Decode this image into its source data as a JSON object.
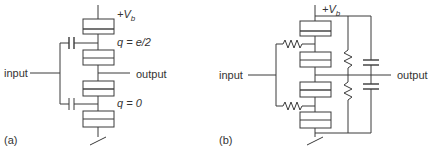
{
  "panel_a": {
    "tag": "(a)",
    "supply_label": "+V",
    "supply_sub": "b",
    "input_label": "input",
    "output_label": "output",
    "charge_upper": "q = e/2",
    "charge_lower": "q = 0"
  },
  "panel_b": {
    "tag": "(b)",
    "supply_label": "+V",
    "supply_sub": "b",
    "input_label": "input",
    "output_label": "output"
  },
  "colors": {
    "line": "#3a3a3a",
    "text": "#333333",
    "background": "#ffffff"
  }
}
